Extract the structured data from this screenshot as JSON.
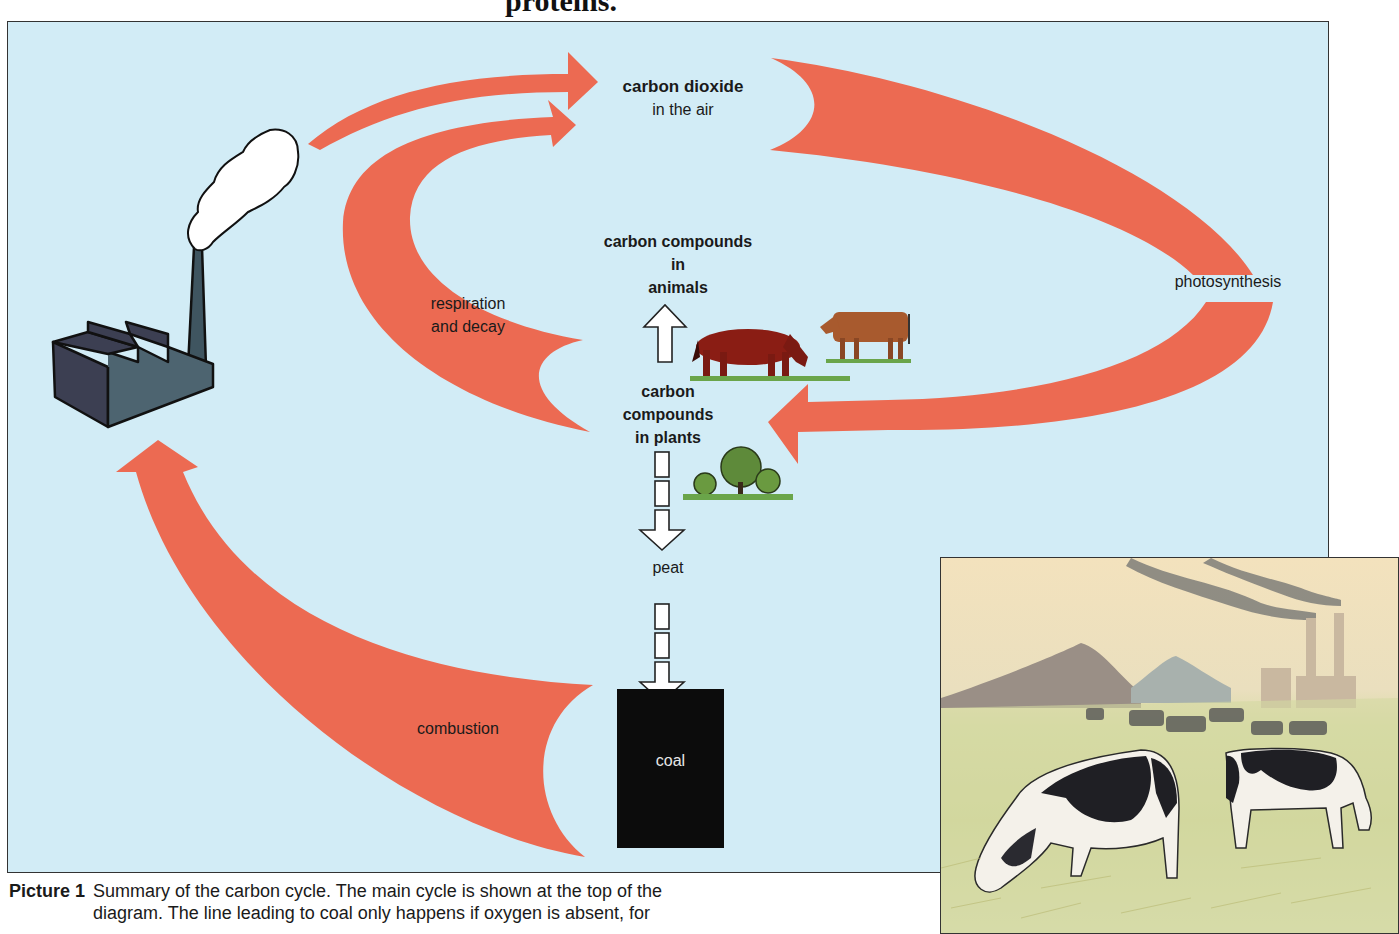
{
  "page": {
    "heading_fragment": "proteins."
  },
  "diagram": {
    "title": "Carbon cycle",
    "colors": {
      "background": "#d2ecf6",
      "arrow": "#ec6a52",
      "factory": "#3f5560",
      "coal": "#0c0c0c"
    },
    "nodes": {
      "co2_title": "carbon dioxide",
      "co2_sub": "in the air",
      "animals_line1": "carbon compounds",
      "animals_line2": "in",
      "animals_line3": "animals",
      "plants_line1": "carbon",
      "plants_line2": "compounds",
      "plants_line3": "in plants",
      "peat": "peat",
      "coal": "coal"
    },
    "processes": {
      "respiration_line1": "respiration",
      "respiration_line2": "and decay",
      "photosynthesis": "photosynthesis",
      "combustion": "combustion"
    },
    "icons": [
      "factory-icon",
      "smoke-icon",
      "horse-icon",
      "cow-icon",
      "trees-icon"
    ]
  },
  "photo": {
    "description": "Illustration of black-and-white cows grazing in a field with smoking factory chimneys and slag heaps in the background"
  },
  "caption": {
    "label": "Picture 1",
    "line1": "Summary of the carbon cycle. The main cycle is shown at the top of the",
    "line2": "diagram. The line leading to coal only happens if oxygen is absent, for"
  }
}
